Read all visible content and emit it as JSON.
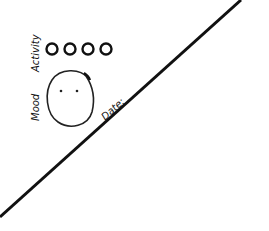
{
  "sketch": {
    "labels": {
      "activity": "Activity",
      "mood": "Mood",
      "date": "Date:"
    },
    "activity_circles": {
      "count": 4,
      "centers_x": [
        52,
        70,
        88,
        106
      ],
      "center_y": 49,
      "radius": 5
    },
    "mood_face": {
      "expression": "neutral",
      "eyes": 2
    },
    "diagonal_line": {
      "from": [
        0,
        217
      ],
      "to": [
        241,
        0
      ]
    },
    "colors": {
      "ink": "#111111",
      "background": "#ffffff"
    }
  }
}
